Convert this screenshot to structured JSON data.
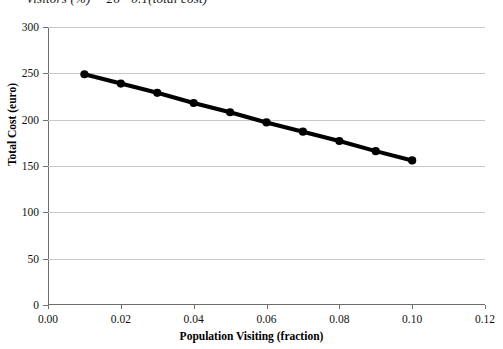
{
  "equation_note": "Visitors (%) = 26 - 0.1(total cost)",
  "chart_data": {
    "type": "line",
    "title": "",
    "xlabel": "Population Visiting (fraction)",
    "ylabel": "Total Cost (euro)",
    "xlim": [
      0.0,
      0.12
    ],
    "ylim": [
      0,
      300
    ],
    "xticks": [
      "0.00",
      "0.02",
      "0.04",
      "0.06",
      "0.08",
      "0.10",
      "0.12"
    ],
    "xtick_values": [
      0.0,
      0.02,
      0.04,
      0.06,
      0.08,
      0.1,
      0.12
    ],
    "yticks": [
      "0",
      "50",
      "100",
      "150",
      "200",
      "250",
      "300"
    ],
    "ytick_values": [
      0,
      50,
      100,
      150,
      200,
      250,
      300
    ],
    "grid": "horizontal",
    "legend": "none",
    "series": [
      {
        "name": "Total Cost",
        "marker": "filled-circle",
        "color": "#000000",
        "line_width": 4,
        "x": [
          0.01,
          0.02,
          0.03,
          0.04,
          0.05,
          0.06,
          0.07,
          0.08,
          0.09,
          0.1
        ],
        "values": [
          249,
          239,
          229,
          218,
          208,
          197,
          187,
          177,
          166,
          156
        ]
      }
    ]
  }
}
